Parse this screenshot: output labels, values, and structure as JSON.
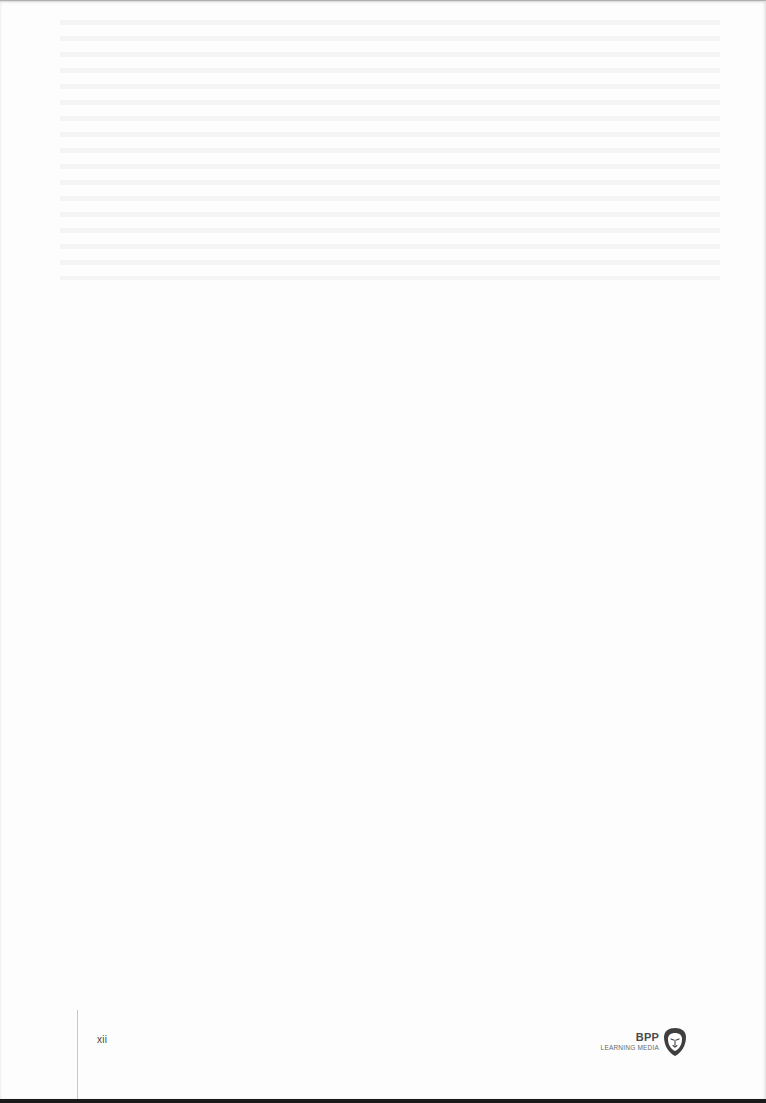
{
  "page": {
    "page_number": "xii",
    "background_color": "#fdfdfd"
  },
  "footer": {
    "logo": {
      "brand": "BPP",
      "subtitle": "LEARNING MEDIA",
      "icon": "lion-shield-icon",
      "color": "#4a4a4a"
    }
  }
}
